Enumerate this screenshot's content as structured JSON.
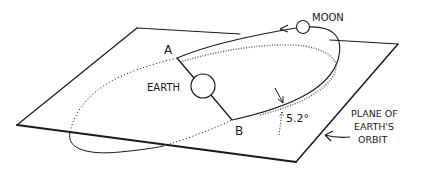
{
  "diagram": {
    "labels": {
      "moon": "MOON",
      "earth": "EARTH",
      "node_a": "A",
      "node_b": "B",
      "inclination": "5.2°",
      "plane_line1": "PLANE OF",
      "plane_line2": "EARTH'S",
      "plane_line3": "ORBIT"
    },
    "colors": {
      "stroke": "#1a1a1a",
      "hatch": "#555555",
      "background": "#ffffff"
    }
  }
}
